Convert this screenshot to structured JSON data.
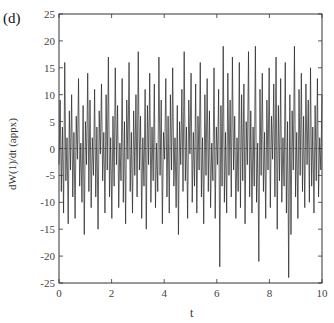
{
  "panel_label": "(d)",
  "chart_data": {
    "type": "line",
    "title": "",
    "xlabel": "t",
    "ylabel": "dW(1)/dt (appx)",
    "xlim": [
      0,
      10
    ],
    "ylim": [
      -25,
      25
    ],
    "x_ticks": [
      0,
      2,
      4,
      6,
      8,
      10
    ],
    "y_ticks": [
      -25,
      -20,
      -15,
      -10,
      -5,
      0,
      5,
      10,
      15,
      20,
      25
    ],
    "x_tick_labels": [
      "0",
      "2",
      "4",
      "6",
      "8",
      "10"
    ],
    "y_tick_labels": [
      "-25",
      "-20",
      "-15",
      "-10",
      "-5",
      "0",
      "5",
      "10",
      "15",
      "20",
      "25"
    ],
    "grid": false,
    "legend": null,
    "zero_line": true,
    "series": [
      {
        "name": "dW(1)/dt",
        "color": "#222222",
        "t_start": 0,
        "t_end": 10,
        "values": [
          -3,
          9,
          -8,
          4,
          -12,
          16,
          -6,
          2,
          -14,
          7,
          -4,
          10,
          -9,
          3,
          -13,
          6,
          -2,
          13,
          -7,
          1,
          -10,
          8,
          -16,
          5,
          -3,
          14,
          -8,
          9,
          -11,
          2,
          -5,
          11,
          -9,
          4,
          -15,
          7,
          -1,
          12,
          -6,
          3,
          -12,
          10,
          -4,
          17,
          -9,
          2,
          -13,
          6,
          -7,
          15,
          -3,
          8,
          -11,
          1,
          -6,
          13,
          -10,
          5,
          -14,
          9,
          -2,
          16,
          -8,
          3,
          -12,
          7,
          -5,
          10,
          -9,
          18,
          -4,
          6,
          -13,
          2,
          -7,
          11,
          -15,
          8,
          -3,
          14,
          -10,
          4,
          -6,
          12,
          -11,
          1,
          -8,
          17,
          -5,
          9,
          -14,
          3,
          -2,
          13,
          -9,
          6,
          -12,
          10,
          -4,
          15,
          -7,
          2,
          -11,
          8,
          -16,
          5,
          -3,
          11,
          -8,
          18,
          -6,
          4,
          -13,
          9,
          -1,
          14,
          -10,
          3,
          -7,
          12,
          -12,
          6,
          -4,
          16,
          -9,
          2,
          -14,
          10,
          -5,
          13,
          -8,
          7,
          -11,
          1,
          -6,
          15,
          -13,
          4,
          -3,
          11,
          -22,
          8,
          -7,
          19,
          -10,
          3,
          -12,
          14,
          -5,
          9,
          -9,
          17,
          -4,
          6,
          -13,
          2,
          -8,
          16,
          -11,
          10,
          -6,
          12,
          -14,
          5,
          -3,
          18,
          -9,
          7,
          -12,
          4,
          -7,
          19,
          -10,
          1,
          -21,
          11,
          -5,
          14,
          -8,
          3,
          -13,
          9,
          -4,
          15,
          -11,
          6,
          -2,
          12,
          -9,
          17,
          -15,
          8,
          -6,
          13,
          -10,
          2,
          -7,
          16,
          -12,
          5,
          -24,
          10,
          -16,
          7,
          -4,
          19,
          -9,
          3,
          -13,
          11,
          -5,
          14,
          -8,
          6,
          -11,
          12,
          -3,
          9,
          -10,
          15,
          -7,
          4,
          -12,
          8,
          -6,
          13,
          -9,
          2,
          -4,
          10
        ]
      }
    ]
  }
}
